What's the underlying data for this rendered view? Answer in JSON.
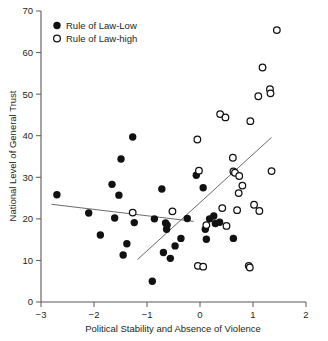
{
  "chart_data": {
    "type": "scatter",
    "title": "",
    "xlabel": "Political Stability and Absence of Violence",
    "ylabel": "National Level of General Trust",
    "xlim": [
      -3,
      2
    ],
    "ylim": [
      0,
      70
    ],
    "xticks": [
      -3,
      -2,
      -1,
      0,
      1,
      2
    ],
    "xtick_labels": [
      "−3",
      "−2",
      "−1",
      "0",
      "1",
      "2"
    ],
    "yticks": [
      0,
      10,
      20,
      30,
      40,
      50,
      60,
      70
    ],
    "ytick_labels": [
      "0",
      "10",
      "20",
      "30",
      "40",
      "50",
      "60",
      "70"
    ],
    "grid": false,
    "legend_position": "top-left",
    "series": [
      {
        "name": "Rule of Law-Low",
        "marker": "filled-circle",
        "color": "#111111",
        "points": [
          [
            -2.7,
            25.8
          ],
          [
            -2.1,
            21.4
          ],
          [
            -1.88,
            16.1
          ],
          [
            -1.66,
            28.3
          ],
          [
            -1.61,
            20.2
          ],
          [
            -1.53,
            25.7
          ],
          [
            -1.49,
            34.4
          ],
          [
            -1.45,
            11.3
          ],
          [
            -1.38,
            14.0
          ],
          [
            -1.27,
            39.7
          ],
          [
            -1.24,
            19.1
          ],
          [
            -0.9,
            5.0
          ],
          [
            -0.86,
            20.0
          ],
          [
            -0.72,
            27.2
          ],
          [
            -0.69,
            11.9
          ],
          [
            -0.65,
            19.0
          ],
          [
            -0.63,
            17.5
          ],
          [
            -0.62,
            18.5
          ],
          [
            -0.56,
            10.5
          ],
          [
            -0.47,
            13.5
          ],
          [
            -0.36,
            15.3
          ],
          [
            -0.24,
            20.1
          ],
          [
            -0.07,
            30.5
          ],
          [
            0.06,
            27.5
          ],
          [
            0.1,
            17.5
          ],
          [
            0.12,
            15.1
          ],
          [
            0.18,
            20.0
          ],
          [
            0.26,
            20.7
          ],
          [
            0.29,
            18.9
          ],
          [
            0.37,
            19.2
          ],
          [
            0.63,
            15.3
          ]
        ]
      },
      {
        "name": "Rule of Law-high",
        "marker": "open-circle",
        "color": "#111111",
        "points": [
          [
            -1.27,
            21.5
          ],
          [
            -0.52,
            21.8
          ],
          [
            -0.05,
            39.1
          ],
          [
            -0.04,
            8.7
          ],
          [
            -0.02,
            31.6
          ],
          [
            0.06,
            8.5
          ],
          [
            0.12,
            18.5
          ],
          [
            0.38,
            45.2
          ],
          [
            0.42,
            22.6
          ],
          [
            0.48,
            44.4
          ],
          [
            0.5,
            18.3
          ],
          [
            0.62,
            34.7
          ],
          [
            0.63,
            31.4
          ],
          [
            0.66,
            31.1
          ],
          [
            0.7,
            22.1
          ],
          [
            0.73,
            26.2
          ],
          [
            0.74,
            30.3
          ],
          [
            0.8,
            28.0
          ],
          [
            0.92,
            8.7
          ],
          [
            0.94,
            8.3
          ],
          [
            0.95,
            43.5
          ],
          [
            1.02,
            23.4
          ],
          [
            1.1,
            49.5
          ],
          [
            1.12,
            21.9
          ],
          [
            1.18,
            56.4
          ],
          [
            1.32,
            51.2
          ],
          [
            1.33,
            50.2
          ],
          [
            1.35,
            31.5
          ],
          [
            1.45,
            65.4
          ]
        ]
      }
    ],
    "trend_lines": [
      {
        "name": "low-group-fit",
        "x_start": -2.8,
        "y_start": 23.5,
        "x_end": -0.12,
        "y_end": 19.4
      },
      {
        "name": "high-group-fit",
        "x_start": -1.18,
        "y_start": 10.2,
        "x_end": 1.35,
        "y_end": 39.6
      }
    ]
  },
  "legend": {
    "items": [
      {
        "label": "Rule of Law-Low",
        "marker": "filled-circle"
      },
      {
        "label": "Rule of Law-high",
        "marker": "open-circle"
      }
    ]
  }
}
